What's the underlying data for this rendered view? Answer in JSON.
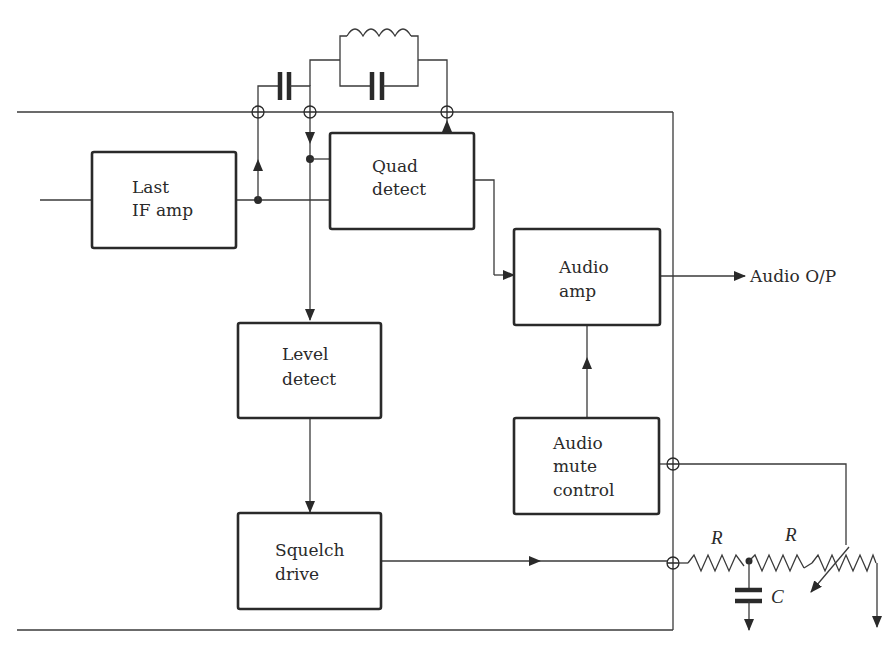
{
  "diagram": {
    "blocks": {
      "last_if_amp": {
        "line1": "Last",
        "line2": "IF amp"
      },
      "quad_detect": {
        "line1": "Quad",
        "line2": "detect"
      },
      "audio_amp": {
        "line1": "Audio",
        "line2": "amp"
      },
      "level_detect": {
        "line1": "Level",
        "line2": "detect"
      },
      "audio_mute_control": {
        "line1": "Audio",
        "line2": "mute",
        "line3": "control"
      },
      "squelch_drive": {
        "line1": "Squelch",
        "line2": "drive"
      }
    },
    "labels": {
      "audio_output": "Audio O/P",
      "resistor_1": "R",
      "resistor_2": "R",
      "capacitor": "C"
    },
    "components": [
      "coupling-capacitor",
      "tank-inductor",
      "tank-capacitor",
      "resistor-R1",
      "resistor-R2",
      "squelch-potentiometer",
      "filter-capacitor-C"
    ],
    "colors": {
      "line": "#3a3a3a",
      "text": "#2a2a2a",
      "background": "#ffffff"
    }
  }
}
